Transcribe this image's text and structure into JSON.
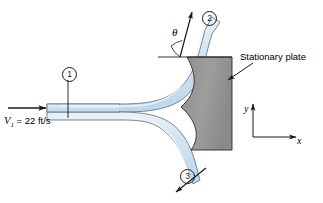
{
  "figure": {
    "type": "fluid-mechanics-schematic",
    "width": 323,
    "height": 203
  },
  "labels": {
    "stationary_plate": "Stationary plate",
    "velocity_symbol": "V",
    "velocity_subscript": "1",
    "velocity_equals": " = 22 ft/s",
    "velocity_full": "V1 = 22 ft/s",
    "theta": "θ",
    "axis_y": "y",
    "axis_x": "x",
    "station_1": "1",
    "station_2": "2",
    "station_3": "3"
  },
  "values": {
    "inlet_velocity": 22,
    "inlet_velocity_units": "ft/s",
    "deflection_angle_symbol": "theta"
  },
  "colors": {
    "jet_fill": "#cfe2f0",
    "jet_fill_light": "#e3eff8",
    "jet_edge": "#5c5c5c",
    "plate_fill": "#9a9a98",
    "plate_edge": "#2b2b2b",
    "line": "#1a1a1a",
    "background": "#ffffff"
  },
  "annotations": {
    "inlet_arrow": "flow-direction-arrow",
    "plate_leader": "leader-arrow-to-plate",
    "upper_jet_arrow": "upper-outlet-direction-arrow",
    "lower_jet_arrow": "lower-outlet-direction-arrow",
    "theta_reference_line": "horizontal-reference-line"
  }
}
